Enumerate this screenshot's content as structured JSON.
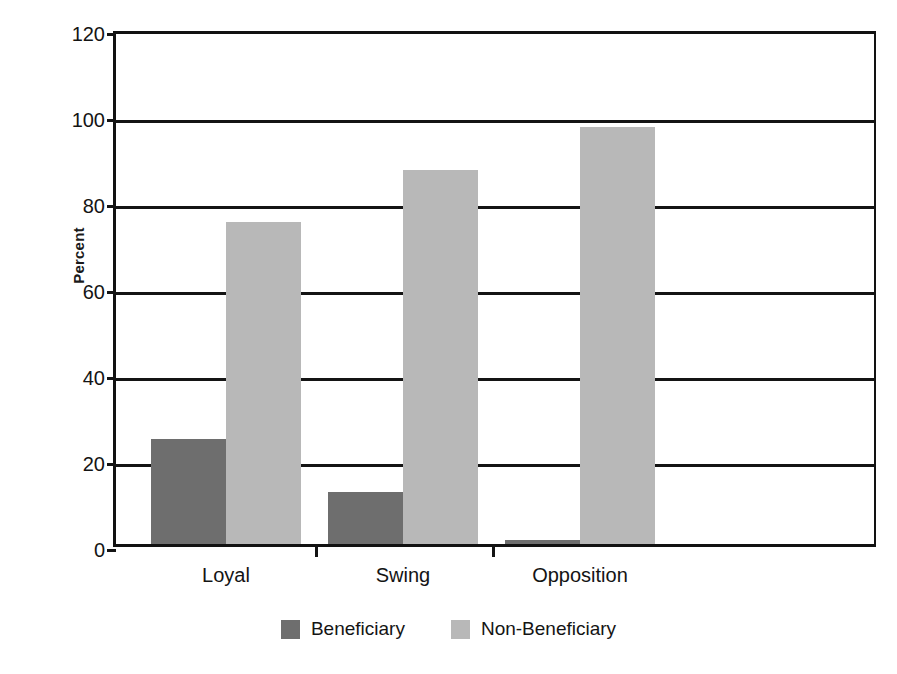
{
  "chart_data": {
    "type": "bar",
    "title": "",
    "subtitle": "",
    "xlabel": "",
    "ylabel": "Percent",
    "ylim": [
      0,
      120
    ],
    "ytick_step": 20,
    "yticks": [
      "0",
      "20",
      "40",
      "60",
      "80",
      "100",
      "120"
    ],
    "grid": true,
    "legend_position": "bottom-center",
    "categories": [
      "Loyal",
      "Swing",
      "Opposition"
    ],
    "series": [
      {
        "name": "Beneficiary",
        "color": "#6e6e6e",
        "values": [
          24.5,
          12,
          1
        ]
      },
      {
        "name": "Non-Beneficiary",
        "color": "#b8b8b8",
        "values": [
          75,
          87,
          97
        ]
      }
    ]
  },
  "legend": {
    "entries": [
      {
        "label": "Beneficiary",
        "swatch": "beneficiary-swatch"
      },
      {
        "label": "Non-Beneficiary",
        "swatch": "non-beneficiary-swatch"
      }
    ]
  }
}
